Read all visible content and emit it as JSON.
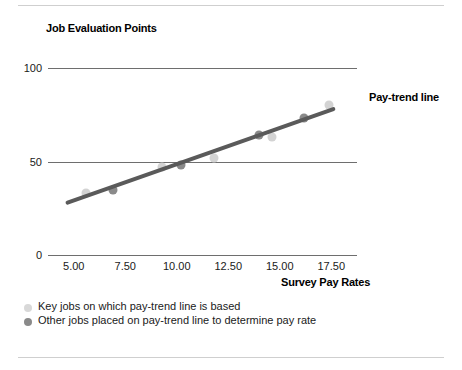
{
  "figure": {
    "title": "Job Evaluation Points",
    "trendline_label": "Pay-trend line",
    "xaxis_title": "Survey Pay Rates"
  },
  "legend": {
    "items": [
      {
        "marker": "key-job-dot",
        "label": "Key jobs on which pay-trend line is based",
        "color": "#d8d8d8"
      },
      {
        "marker": "other-job-dot",
        "label": "Other jobs placed on pay-trend line to determine pay rate",
        "color": "#8a8a8a"
      }
    ]
  },
  "axes": {
    "y_ticks": [
      "100",
      "50",
      "0"
    ],
    "x_ticks": [
      "5.00",
      "7.50",
      "10.00",
      "12.50",
      "15.00",
      "17.50"
    ]
  },
  "colors": {
    "key_job": "#d3d3d3",
    "other_job": "#8a8a8a",
    "trend_line": "#5a5a5a",
    "gridline": "#6e6e6e",
    "frame_rule": "#cfcfcf"
  },
  "chart_data": {
    "type": "scatter",
    "title": "Job Evaluation Points",
    "xlabel": "Survey Pay Rates",
    "ylabel": "Job Evaluation Points",
    "xlim": [
      3.75,
      18.75
    ],
    "ylim": [
      0,
      100
    ],
    "grid": true,
    "gridlines_y": [
      0,
      50,
      100
    ],
    "x_tick_values": [
      5.0,
      7.5,
      10.0,
      12.5,
      15.0,
      17.5
    ],
    "x_tick_labels": [
      "5.00",
      "7.50",
      "10.00",
      "12.50",
      "15.00",
      "17.50"
    ],
    "y_tick_values": [
      0,
      50,
      100
    ],
    "y_tick_labels": [
      "0",
      "50",
      "100"
    ],
    "legend_position": "below-axes-left",
    "annotations": [
      {
        "text": "Pay-trend line",
        "x": 18.1,
        "y": 79,
        "bold": true
      }
    ],
    "series": [
      {
        "name": "Key jobs on which pay-trend line is based",
        "marker": "circle",
        "color": "#d3d3d3",
        "points": [
          {
            "x": 5.6,
            "y": 33
          },
          {
            "x": 9.3,
            "y": 47
          },
          {
            "x": 11.8,
            "y": 52
          },
          {
            "x": 14.6,
            "y": 63
          },
          {
            "x": 17.4,
            "y": 80
          }
        ]
      },
      {
        "name": "Other jobs placed on pay-trend line to determine pay rate",
        "marker": "circle",
        "color": "#8a8a8a",
        "points": [
          {
            "x": 6.9,
            "y": 35
          },
          {
            "x": 10.2,
            "y": 48
          },
          {
            "x": 14.0,
            "y": 64
          },
          {
            "x": 16.2,
            "y": 73
          }
        ]
      },
      {
        "name": "Pay-trend line",
        "type": "line",
        "color": "#5a5a5a",
        "points": [
          {
            "x": 4.7,
            "y": 28
          },
          {
            "x": 17.6,
            "y": 78
          }
        ]
      }
    ]
  }
}
